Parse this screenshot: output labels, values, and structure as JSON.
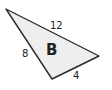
{
  "diagram": {
    "shape": "triangle",
    "name": "B",
    "fill": "#eeeeee",
    "stroke": "#2a2a2a",
    "vertices": [
      [
        6,
        9
      ],
      [
        99,
        56
      ],
      [
        52,
        79
      ]
    ],
    "sides": {
      "top": "12",
      "left": "8",
      "bottom": "4"
    }
  }
}
